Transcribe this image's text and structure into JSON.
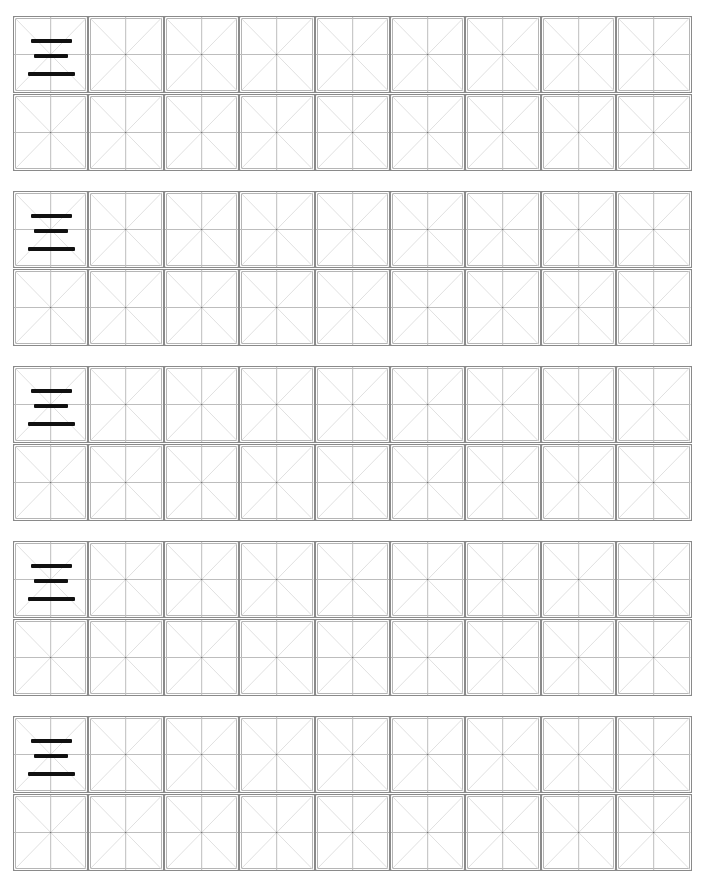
{
  "worksheet": {
    "type": "Chinese character writing practice (米字格 grid)",
    "character": "三",
    "blocks": 5,
    "rows_per_block": 2,
    "columns": 9,
    "colors": {
      "cell_border": "#8a8a8a",
      "cell_inner_border": "#b5b5b5",
      "guide_lines": "#bdbdbd",
      "diagonal_lines": "#dcdcdc",
      "character": "#111111"
    }
  }
}
